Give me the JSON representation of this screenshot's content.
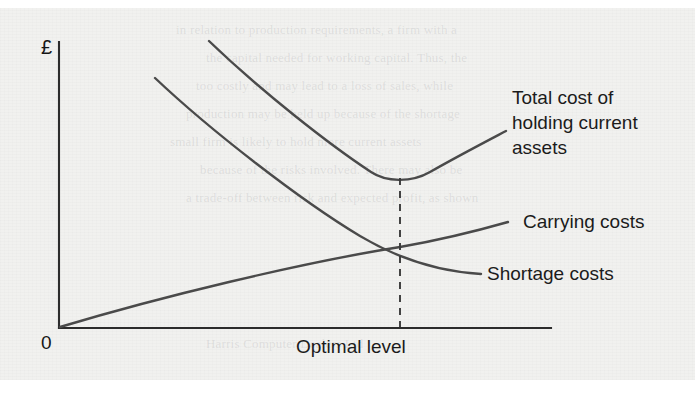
{
  "figure": {
    "kind": "line-chart",
    "caption_visible": false,
    "background_color": "#f1f1ef",
    "ink_color": "#4a4a4a",
    "axis_color": "#2c2c2c"
  },
  "axes": {
    "y_axis_label": "£",
    "y_axis_name": "Cost in pounds sterling",
    "origin_label": "0",
    "x_axis_label": "Optimal level",
    "x_axis_name": "Level of current assets held"
  },
  "labels": {
    "total_cost": "Total cost of\nholding current\nassets",
    "carrying_costs": "Carrying costs",
    "shortage_costs": "Shortage costs"
  },
  "bleed_through": [
    {
      "text": "in relation to production requirements, a firm with a",
      "x": 176,
      "y": 22
    },
    {
      "text": "the capital needed for working capital. Thus, the",
      "x": 206,
      "y": 50
    },
    {
      "text": "too costly and may lead to a loss of sales, while",
      "x": 196,
      "y": 78
    },
    {
      "text": "production may be held up because of the shortage",
      "x": 186,
      "y": 106
    },
    {
      "text": "small firm is likely to hold more current assets",
      "x": 170,
      "y": 134
    },
    {
      "text": "because of the risks involved. There may also be",
      "x": 200,
      "y": 162
    },
    {
      "text": "a trade-off between risk and expected profit, as shown",
      "x": 186,
      "y": 190
    },
    {
      "text": "Harris Computer Dealers Ltd",
      "x": 206,
      "y": 336
    }
  ],
  "chart_data": {
    "type": "line",
    "title": "",
    "xlabel": "Optimal level",
    "ylabel": "£",
    "xlim": [
      0,
      100
    ],
    "ylim": [
      0,
      100
    ],
    "grid": false,
    "legend": "inline-right-annotations",
    "annotations": [
      {
        "label": "Optimal level",
        "type": "vertical-dashed-line",
        "x": 69
      },
      {
        "label": "minimum of total cost curve",
        "x": 69,
        "y": 52
      },
      {
        "label": "intersection of carrying and shortage costs",
        "x": 69,
        "y": 27
      }
    ],
    "series": [
      {
        "name": "Total cost of holding current assets",
        "shape": "u-shaped convex curve with minimum at the optimal level",
        "x": [
          30,
          37,
          44,
          51,
          58,
          65,
          69,
          76,
          83,
          90
        ],
        "y": [
          100,
          90,
          80,
          71,
          63,
          56,
          52,
          58,
          70,
          86
        ]
      },
      {
        "name": "Shortage costs",
        "shape": "decreasing convex curve flattening to the right",
        "x": [
          19,
          28,
          38,
          48,
          58,
          69,
          78,
          86
        ],
        "y": [
          100,
          83,
          67,
          52,
          39,
          27,
          21,
          19
        ]
      },
      {
        "name": "Carrying costs",
        "shape": "increasing near-linear curve from the origin",
        "x": [
          0,
          14,
          28,
          42,
          55,
          69,
          80,
          91
        ],
        "y": [
          0,
          5,
          10,
          15,
          21,
          27,
          33,
          37
        ]
      }
    ]
  }
}
